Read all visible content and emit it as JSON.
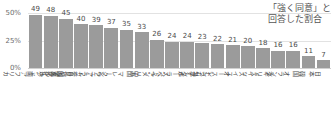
{
  "annotation": {
    "line1": "「強く同意」と",
    "line2": "回答した割合"
  },
  "axis": {
    "yticks": [
      "50%",
      "25%",
      "0%"
    ]
  },
  "colors": {
    "bar": "#9b9b9b",
    "grid": "#e2e2e2",
    "text": "#4a4a4a"
  },
  "chart_data": {
    "type": "bar",
    "title": "",
    "subtitle": "",
    "xlabel": "",
    "ylabel": "",
    "ylim": [
      0,
      55
    ],
    "yticks": [
      0,
      25,
      50
    ],
    "ytick_labels": [
      "0%",
      "25%",
      "50%"
    ],
    "grid": true,
    "legend": null,
    "annotations": [
      "「強く同意」と回答した割合"
    ],
    "value_suffix": "",
    "categories": [
      "南アフリカ",
      "インド",
      "カタール",
      "サウジアラビア",
      "アラブ首長国連邦",
      "クウェート",
      "マレーシア",
      "中国",
      "アメリカ",
      "スペイン",
      "ポーランド",
      "カナダ",
      "シンガポール",
      "オーストラリア",
      "スイス",
      "ドイツ",
      "イギリス",
      "オランダ",
      "韓国",
      "日本"
    ],
    "values": [
      49,
      48,
      45,
      40,
      39,
      37,
      35,
      33,
      26,
      24,
      24,
      23,
      22,
      21,
      20,
      18,
      16,
      16,
      11,
      7
    ]
  }
}
